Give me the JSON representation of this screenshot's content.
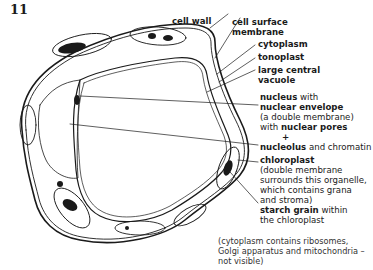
{
  "figure": {
    "number": "11",
    "colors": {
      "ink": "#1a1a1a",
      "background": "#ffffff"
    }
  },
  "labels": [
    {
      "id": "cell-wall",
      "bold": "cell wall",
      "normal": ""
    },
    {
      "id": "cell-surface-membrane",
      "bold": "cell surface",
      "bold2": "membrane"
    },
    {
      "id": "cytoplasm",
      "bold": "cytoplasm"
    },
    {
      "id": "tonoplast",
      "bold": "tonoplast"
    },
    {
      "id": "large-central-vacuole",
      "bold": "large central",
      "bold2": "vacuole"
    },
    {
      "id": "nucleus",
      "line1_bold": "nucleus",
      "line1_normal": " with",
      "line2_bold": "nuclear envelope",
      "line3_normal": "(a double membrane)",
      "line4_normal": "with ",
      "line4_bold": "nuclear pores",
      "line5": "+",
      "line6_bold": "nucleolus",
      "line6_normal": " and chromatin"
    },
    {
      "id": "chloroplast",
      "line1_bold": "chloroplast",
      "line2": "(double membrane",
      "line3": "surrounds this organelle,",
      "line4": "which contains grana",
      "line5": "and stroma)"
    },
    {
      "id": "starch-grain",
      "line1_bold": "starch grain",
      "line1_normal": " within",
      "line2": "the chloroplast"
    }
  ],
  "note": {
    "line1": "(cytoplasm contains ribosomes,",
    "line2": "Golgi apparatus and mitochondria –",
    "line3": "not visible)"
  }
}
